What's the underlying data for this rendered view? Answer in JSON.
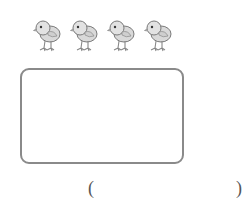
{
  "illustration": {
    "item": "chick",
    "count": 4,
    "items": [
      {
        "icon": "chick-icon"
      },
      {
        "icon": "chick-icon"
      },
      {
        "icon": "chick-icon"
      },
      {
        "icon": "chick-icon"
      }
    ]
  },
  "answer_box": {
    "content": ""
  },
  "answer_blank": {
    "open": "(",
    "close": ")",
    "value": ""
  },
  "colors": {
    "chick_fill": "#d9d9d9",
    "chick_outline": "#7a7a7a",
    "box_border": "#8a8a8a"
  }
}
